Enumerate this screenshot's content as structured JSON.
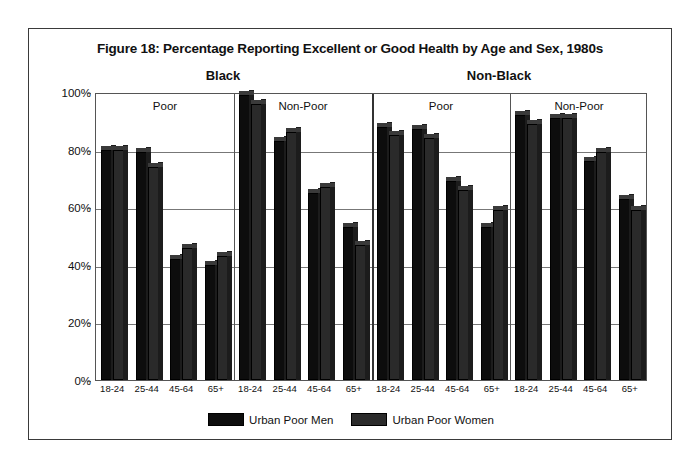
{
  "figure": {
    "title": "Figure 18:  Percentage Reporting Excellent or Good Health by Age and Sex, 1980s"
  },
  "legend": {
    "items": [
      {
        "label": "Urban Poor Men",
        "color": "#0d0d0d",
        "swatch": "men"
      },
      {
        "label": "Urban Poor Women",
        "color": "#2b2b2b",
        "swatch": "women"
      }
    ]
  },
  "axes": {
    "yticks": [
      "0%",
      "20%",
      "40%",
      "60%",
      "80%",
      "100%"
    ],
    "ytick_values": [
      0,
      20,
      40,
      60,
      80,
      100
    ],
    "ylim": [
      0,
      100
    ]
  },
  "supergroups": [
    {
      "label": "Black"
    },
    {
      "label": "Non-Black"
    }
  ],
  "panels": [
    {
      "label": "Poor"
    },
    {
      "label": "Non-Poor"
    },
    {
      "label": "Poor"
    },
    {
      "label": "Non-Poor"
    }
  ],
  "chart_data": {
    "type": "bar",
    "title": "Figure 18:  Percentage Reporting Excellent or Good Health by Age and Sex, 1980s",
    "xlabel": "",
    "ylabel": "",
    "ylim": [
      0,
      100
    ],
    "grid": true,
    "legend_position": "bottom",
    "categories": [
      "Black / Poor / 18-24",
      "Black / Poor / 25-44",
      "Black / Poor / 45-64",
      "Black / Poor / 65+",
      "Black / Non-Poor / 18-24",
      "Black / Non-Poor / 25-44",
      "Black / Non-Poor / 45-64",
      "Black / Non-Poor / 65+",
      "Non-Black / Poor / 18-24",
      "Non-Black / Poor / 25-44",
      "Non-Black / Poor / 45-64",
      "Non-Black / Poor / 65+",
      "Non-Black / Non-Poor / 18-24",
      "Non-Black / Non-Poor / 25-44",
      "Non-Black / Non-Poor / 45-64",
      "Non-Black / Non-Poor / 65+"
    ],
    "age_labels": [
      "18-24",
      "25-44",
      "45-64",
      "65+"
    ],
    "series": [
      {
        "name": "Urban Poor Men",
        "values": [
          80,
          79,
          42,
          40,
          99,
          83,
          65,
          53,
          88,
          87,
          69,
          53,
          92,
          91,
          76,
          63
        ]
      },
      {
        "name": "Urban Poor Women",
        "values": [
          80,
          74,
          46,
          43,
          96,
          86,
          67,
          47,
          85,
          84,
          66,
          59,
          89,
          91,
          79,
          59
        ]
      }
    ]
  }
}
